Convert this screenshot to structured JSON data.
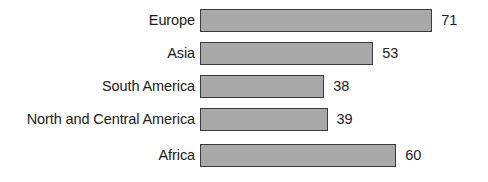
{
  "chart_data": {
    "type": "bar",
    "orientation": "horizontal",
    "title": "",
    "subtitle": "",
    "xlabel": "",
    "ylabel": "",
    "grid": false,
    "legend": false,
    "legend_position": "none",
    "axis_visible": false,
    "xlim": [
      0,
      71
    ],
    "categories": [
      "Europe",
      "Asia",
      "South America",
      "North and Central America",
      "Africa"
    ],
    "values": [
      71,
      53,
      38,
      39,
      60
    ],
    "value_labels": [
      "71",
      "53",
      "38",
      "39",
      "60"
    ],
    "bars": [
      {
        "category": "Europe",
        "value": 71,
        "label": "71"
      },
      {
        "category": "Asia",
        "value": 53,
        "label": "53"
      },
      {
        "category": "South America",
        "value": 38,
        "label": "38"
      },
      {
        "category": "North and Central America",
        "value": 39,
        "label": "39"
      },
      {
        "category": "Africa",
        "value": 60,
        "label": "60"
      }
    ],
    "colors": {
      "bar_fill": "#a9a9a9",
      "bar_border": "#3a3a3a",
      "text": "#1a1a1a",
      "background": "#ffffff"
    }
  },
  "layout": {
    "plot_left_px": 200,
    "px_per_unit": 3.27,
    "row_tops_px": [
      8,
      41,
      74,
      107,
      143
    ],
    "bar_height_px": 23
  }
}
